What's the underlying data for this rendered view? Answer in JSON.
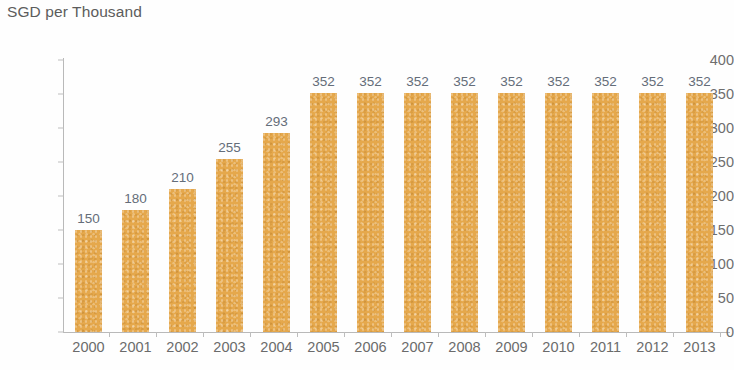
{
  "chart_data": {
    "type": "bar",
    "title": "SGD per Thousand",
    "xlabel": "",
    "ylabel": "",
    "categories": [
      "2000",
      "2001",
      "2002",
      "2003",
      "2004",
      "2005",
      "2006",
      "2007",
      "2008",
      "2009",
      "2010",
      "2011",
      "2012",
      "2013"
    ],
    "values": [
      150,
      180,
      210,
      255,
      293,
      352,
      352,
      352,
      352,
      352,
      352,
      352,
      352,
      352
    ],
    "data_labels": [
      "150",
      "180",
      "210",
      "255",
      "293",
      "352",
      "352",
      "352",
      "352",
      "352",
      "352",
      "352",
      "352",
      "352"
    ],
    "ylim": [
      0,
      400
    ],
    "ytick_labels": [
      "400",
      "350",
      "300",
      "250",
      "200",
      "150",
      "100",
      "50",
      "0"
    ],
    "ytick_values": [
      400,
      350,
      300,
      250,
      200,
      150,
      100,
      50,
      0
    ],
    "grid": false,
    "legend": null,
    "bar_color": "#e5a84c",
    "axis_color": "#b9b9b9",
    "title_color": "#5c5c5c",
    "label_color": "#646d79",
    "tick_label_color": "#6b6b6b",
    "background_color": "#fefefe"
  }
}
